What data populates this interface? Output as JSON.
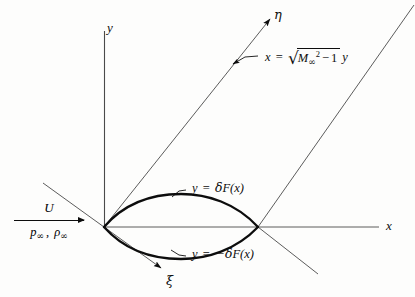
{
  "figure": {
    "background_color": "#fdfdfc",
    "ink_color": "#0d0d0d",
    "width": 415,
    "height": 297
  },
  "axes": {
    "y_label": "y",
    "x_label": "x",
    "eta_label": "η",
    "xi_label": "ξ"
  },
  "freestream": {
    "velocity": "U",
    "state": "p∞, ρ∞"
  },
  "mach_line": {
    "equation_plain": "x = √(M∞² − 1) y",
    "lhs_var": "x",
    "equals": "=",
    "mach_symbol": "M",
    "mach_subscript": "∞",
    "mach_exponent": "2",
    "minus": "−",
    "one": "1",
    "trailing_var": "y"
  },
  "body": {
    "upper_surface_label": "y = δF(x)",
    "lower_surface_label": "y = −δF(x)",
    "upper_label_parts": {
      "var": "y",
      "equals": "=",
      "delta": "δ",
      "fn": "F",
      "arg": "(x)"
    },
    "lower_label_parts": {
      "var": "y",
      "equals": "=",
      "sign": "−",
      "delta": "δ",
      "fn": "F",
      "arg": "(x)"
    }
  },
  "geometry": {
    "origin": {
      "x": 104,
      "y": 227
    },
    "trailing_edge": {
      "x": 258,
      "y": 227
    },
    "max_thickness_half": 22
  }
}
